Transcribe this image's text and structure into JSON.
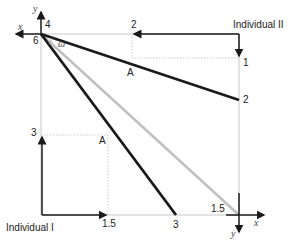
{
  "diagram": {
    "type": "edgeworth-box",
    "individual_1_label": "Individual I",
    "individual_2_label": "Individual II",
    "axis_x": "x",
    "axis_y": "y",
    "angle_label": "ω",
    "point_label": "A",
    "tick_labels": {
      "top_origin_y": "4",
      "top_origin_x": "6",
      "top_2": "2",
      "right_1": "1",
      "right_2": "2",
      "left_3": "3",
      "bottom_1_5": "1.5",
      "bottom_3": "3",
      "corner_1_5": "1.5"
    },
    "colors": {
      "dark_line": "#1a1a1a",
      "light_line": "#c0c0c0",
      "guide": "#bdbdbd"
    }
  }
}
